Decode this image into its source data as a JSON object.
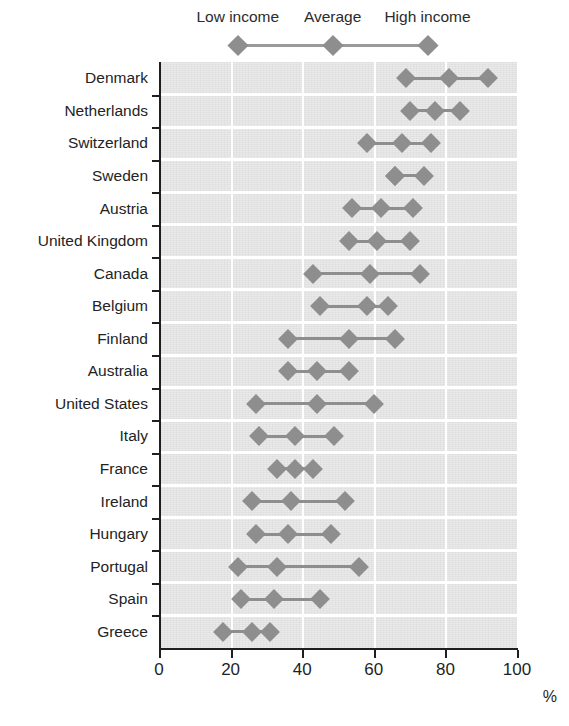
{
  "chart_data": {
    "type": "line",
    "title": "",
    "subtitle": "",
    "xlabel": "%",
    "ylabel": "",
    "xlim": [
      0,
      100
    ],
    "xticks": [
      0,
      20,
      40,
      60,
      80,
      100
    ],
    "xticklabels": [
      "0",
      "20",
      "40",
      "60",
      "80",
      "100"
    ],
    "grid": "vertical-white-gridlines",
    "legend_position": "top",
    "orientation": "horizontal",
    "marker": "diamond",
    "series_names": [
      "Low income",
      "Average",
      "High income"
    ],
    "categories": [
      "Denmark",
      "Netherlands",
      "Switzerland",
      "Sweden",
      "Austria",
      "United Kingdom",
      "Canada",
      "Belgium",
      "Finland",
      "Australia",
      "United States",
      "Italy",
      "France",
      "Ireland",
      "Hungary",
      "Portugal",
      "Spain",
      "Greece"
    ],
    "series": [
      {
        "name": "Low income",
        "values": [
          69,
          70,
          58,
          66,
          54,
          53,
          43,
          45,
          36,
          36,
          27,
          28,
          33,
          26,
          27,
          22,
          23,
          18
        ]
      },
      {
        "name": "Average",
        "values": [
          81,
          77,
          68,
          66,
          62,
          61,
          59,
          58,
          53,
          44,
          44,
          38,
          38,
          37,
          36,
          33,
          32,
          26
        ]
      },
      {
        "name": "High income",
        "values": [
          92,
          84,
          76,
          74,
          71,
          70,
          73,
          64,
          66,
          53,
          60,
          49,
          43,
          52,
          48,
          56,
          45,
          31
        ]
      }
    ]
  },
  "legend": {
    "items": [
      {
        "label": "Low income",
        "value": 22
      },
      {
        "label": "Average",
        "value": 48.5
      },
      {
        "label": "High income",
        "value": 75
      }
    ]
  },
  "axis": {
    "unit": "%",
    "ticks": [
      "0",
      "20",
      "40",
      "60",
      "80",
      "100"
    ]
  },
  "colors": {
    "marker": "#8e8e8e",
    "line": "#8e8e8e",
    "plot_background": "#e4e4e4",
    "gridline": "#ffffff",
    "axis": "#1f1f1f",
    "text": "#232323"
  }
}
